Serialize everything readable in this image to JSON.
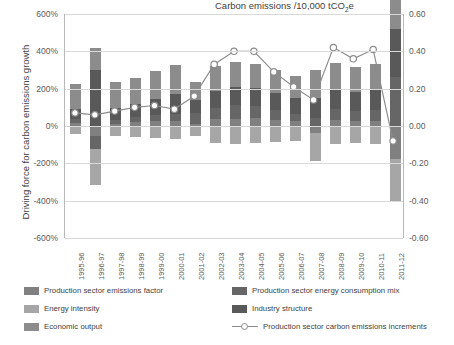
{
  "chart_data": {
    "type": "bar",
    "title": "",
    "xlabel": "",
    "ylabel": "Driving force for carbon emissions growth",
    "y2label": "Carbon emissions /10,000 tCO2e",
    "categories": [
      "1995-96",
      "1996-97",
      "1997-98",
      "1998-99",
      "1999-00",
      "2000-01",
      "2001-02",
      "2002-03",
      "2003-04",
      "2004-05",
      "2005-06",
      "2006-07",
      "2007-08",
      "2008-09",
      "2009-10",
      "2010-11",
      "2011-12"
    ],
    "ylim": [
      -6,
      6
    ],
    "yticks": [
      "-600%",
      "-400%",
      "-200%",
      "0%",
      "200%",
      "400%",
      "600%"
    ],
    "y2lim": [
      -0.6,
      0.6
    ],
    "y2ticks": [
      "-0.60",
      "-0.40",
      "-0.20",
      "0.00",
      "0.20",
      "0.40",
      "0.60"
    ],
    "grid": true,
    "legend_position": "bottom",
    "series": [
      {
        "name": "Production sector emissions factor",
        "color": "#808080",
        "values": [
          0.15,
          -0.55,
          0.12,
          0.2,
          0.25,
          0.28,
          0.1,
          0.35,
          0.4,
          0.42,
          0.3,
          0.25,
          -0.35,
          0.3,
          0.26,
          0.28,
          -1.75
        ]
      },
      {
        "name": "Production sector energy consumption mix",
        "color": "#666666",
        "values": [
          0.2,
          -0.7,
          0.22,
          0.28,
          0.32,
          0.38,
          0.6,
          0.6,
          0.7,
          0.65,
          0.55,
          0.4,
          0.45,
          0.6,
          0.55,
          0.6,
          2.6
        ]
      },
      {
        "name": "Energy intensity",
        "color": "#a6a6a6",
        "values": [
          -0.45,
          -1.9,
          -0.55,
          -0.6,
          -0.65,
          -0.7,
          -0.55,
          -0.9,
          -0.95,
          -0.9,
          -0.85,
          -0.8,
          -1.55,
          -0.95,
          -0.9,
          -0.95,
          -2.25
        ]
      },
      {
        "name": "Industry structure",
        "color": "#595959",
        "values": [
          0.55,
          3.0,
          0.6,
          0.7,
          0.9,
          1.05,
          0.7,
          0.95,
          1.0,
          0.95,
          0.9,
          0.85,
          1.05,
          1.1,
          1.0,
          1.05,
          2.6
        ]
      },
      {
        "name": "Economic output",
        "color": "#8c8c8c",
        "values": [
          1.35,
          1.2,
          1.4,
          1.4,
          1.45,
          1.55,
          0.95,
          1.3,
          1.35,
          1.3,
          1.25,
          1.2,
          1.5,
          1.4,
          1.35,
          1.4,
          2.55
        ]
      }
    ],
    "line_series": {
      "name": "Production sector carbon emissions increments",
      "color": "#8c8c8c",
      "marker": "circle-open",
      "values": [
        0.07,
        0.06,
        0.08,
        0.1,
        0.11,
        0.09,
        0.16,
        0.33,
        0.4,
        0.4,
        0.29,
        0.21,
        0.14,
        0.42,
        0.36,
        0.41,
        -0.08
      ]
    }
  },
  "legend": {
    "items": [
      {
        "label": "Production sector emissions factor",
        "color": "#808080",
        "type": "swatch"
      },
      {
        "label": "Production sector energy consumption mix",
        "color": "#666666",
        "type": "swatch"
      },
      {
        "label": "Energy intensity",
        "color": "#a6a6a6",
        "type": "swatch"
      },
      {
        "label": "Industry structure",
        "color": "#595959",
        "type": "swatch"
      },
      {
        "label": "Economic output",
        "color": "#8c8c8c",
        "type": "swatch"
      },
      {
        "label": "Production sector carbon emissions increments",
        "color": "#8c8c8c",
        "type": "line"
      }
    ]
  },
  "axis_titles": {
    "left": "Driving force for carbon emissions growth",
    "right_pre": "Carbon emissions /10,000 tCO",
    "right_sub": "2",
    "right_post": "e"
  }
}
